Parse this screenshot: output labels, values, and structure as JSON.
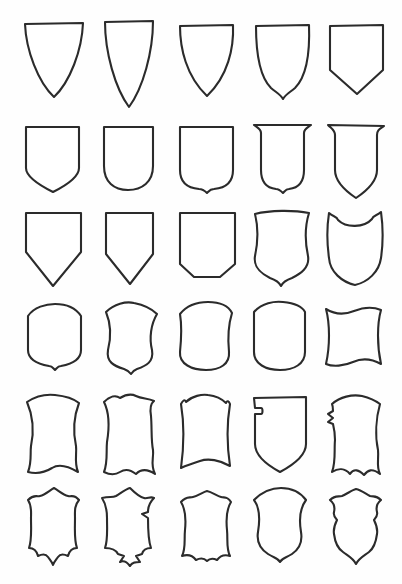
{
  "document": {
    "title": "Escutcheon Shapes Reference Sheet",
    "description": "Hand-drawn line-art sheet of thirty heraldic shield (escutcheon) outlines arranged in a five-column, six-row grid on a plain white page.",
    "background_color": "#fefefe",
    "stroke_color": "#2b2b2b",
    "fill_color": "#ffffff",
    "columns": 5,
    "rows": 6,
    "shape_count": 30,
    "page_width": 402,
    "page_height": 584
  },
  "grid": {
    "shapes": [
      {
        "index": 1,
        "row": 1,
        "column": 1,
        "name": "heater-shield-pointed",
        "label": "Heater shield, broad with sharp point",
        "x": 22,
        "y": 20,
        "width": 64,
        "height": 80,
        "path": "M3,4 L61,3 C60,30 48,62 32,77 C16,62 4,30 3,4 Z"
      },
      {
        "index": 2,
        "row": 1,
        "column": 2,
        "name": "heater-shield-narrow-elongated",
        "label": "Narrow elongated heater shield",
        "x": 100,
        "y": 18,
        "width": 58,
        "height": 92,
        "path": "M5,4 L53,3 C53,34 43,70 29,89 C15,70 5,34 5,4 Z"
      },
      {
        "index": 3,
        "row": 1,
        "column": 3,
        "name": "heater-shield-rounded-flank",
        "label": "Heater shield with rounded flanks",
        "x": 176,
        "y": 22,
        "width": 62,
        "height": 78,
        "path": "M4,4 L57,3 C58,26 52,54 31,74 C10,54 4,26 4,4 Z"
      },
      {
        "index": 4,
        "row": 1,
        "column": 4,
        "name": "shield-ogee-cusped-point",
        "label": "Shield with ogee cusped base point",
        "x": 252,
        "y": 22,
        "width": 62,
        "height": 80,
        "path": "M4,4 L57,3 C58,30 55,54 43,66 C37,71 33,73 31,77 C29,73 25,71 19,66 C7,54 4,30 4,4 Z"
      },
      {
        "index": 5,
        "row": 1,
        "column": 5,
        "name": "shield-straight-chamfered-base",
        "label": "Straight-sided shield, chamfered base",
        "x": 326,
        "y": 22,
        "width": 62,
        "height": 76,
        "path": "M4,4 L57,3 L57,48 L31,72 L4,48 Z"
      },
      {
        "index": 6,
        "row": 2,
        "column": 1,
        "name": "shield-square-chamfered",
        "label": "Square-shouldered shield, chamfered base",
        "x": 22,
        "y": 124,
        "width": 62,
        "height": 72,
        "path": "M4,3 L57,3 L57,44 C57,52 47,60 31,68 C15,60 4,52 4,44 Z"
      },
      {
        "index": 7,
        "row": 2,
        "column": 2,
        "name": "shield-u-round-base",
        "label": "U-shaped shield with round base",
        "x": 100,
        "y": 124,
        "width": 58,
        "height": 70,
        "path": "M4,3 L53,3 L53,42 C53,58 42,66 28,66 C14,66 4,58 4,42 Z"
      },
      {
        "index": 8,
        "row": 2,
        "column": 3,
        "name": "shield-round-corners-nipple",
        "label": "Shield with round corners and central nipple",
        "x": 176,
        "y": 124,
        "width": 62,
        "height": 72,
        "path": "M4,3 L57,3 L57,46 C57,58 50,64 38,65 C34,65 33,67 31,69 C29,67 27,65 23,65 C11,64 4,58 4,46 Z"
      },
      {
        "index": 9,
        "row": 2,
        "column": 4,
        "name": "shield-flanged-top-nipple-base",
        "label": "Shield with flared top flanges and nipple base",
        "x": 252,
        "y": 122,
        "width": 64,
        "height": 74,
        "path": "M2,3 L59,3 C55,6 52,7 52,11 L52,48 C52,60 46,66 37,67 C34,67 33,69 31,71 C29,69 27,67 24,67 C15,66 9,60 9,48 L9,11 C9,7 6,6 2,3 Z"
      },
      {
        "index": 10,
        "row": 2,
        "column": 5,
        "name": "shield-flanged-top-pointed-base",
        "label": "Shield with flared top flanges and pointed base",
        "x": 326,
        "y": 122,
        "width": 62,
        "height": 78,
        "path": "M2,3 L58,4 C54,7 51,8 51,13 L51,48 C51,58 42,68 30,76 C18,68 9,58 9,48 L9,13 C9,8 6,7 2,3 Z"
      },
      {
        "index": 11,
        "row": 3,
        "column": 1,
        "name": "shield-straight-deep-point",
        "label": "Straight-sided shield with deep V point",
        "x": 22,
        "y": 210,
        "width": 64,
        "height": 80,
        "path": "M4,3 L59,3 L59,42 L31,76 L4,42 Z"
      },
      {
        "index": 12,
        "row": 3,
        "column": 2,
        "name": "shield-narrow-deep-point",
        "label": "Narrow shield with deep V point",
        "x": 102,
        "y": 210,
        "width": 56,
        "height": 78,
        "path": "M4,3 L51,3 L51,44 L28,74 L4,44 Z"
      },
      {
        "index": 13,
        "row": 3,
        "column": 3,
        "name": "shield-broad-shallow-chamfer",
        "label": "Broad shield with shallow chamfered base",
        "x": 176,
        "y": 210,
        "width": 64,
        "height": 74,
        "path": "M4,3 L59,3 L59,54 L44,67 L18,67 L4,54 Z"
      },
      {
        "index": 14,
        "row": 3,
        "column": 4,
        "name": "shield-curved-flank-cusped",
        "label": "Shield with curved flanks and cusped point",
        "x": 250,
        "y": 208,
        "width": 66,
        "height": 80,
        "path": "M5,6 C20,2 44,2 59,5 C55,18 55,34 58,48 C60,60 50,66 42,70 C36,72 33,74 31,78 C29,74 26,72 20,70 C12,66 3,60 5,48 C8,34 8,18 5,6 Z"
      },
      {
        "index": 15,
        "row": 3,
        "column": 5,
        "name": "shield-dished-top-notched",
        "label": "Shield with concave dished top and notched corners",
        "x": 324,
        "y": 208,
        "width": 64,
        "height": 80,
        "path": "M5,5 C9,9 13,8 14,12 C22,20 40,20 48,11 C49,7 53,8 57,4 C59,18 59,36 57,50 C55,64 44,74 31,77 C18,74 6,64 5,50 C3,36 3,18 5,5 Z"
      },
      {
        "index": 16,
        "row": 4,
        "column": 1,
        "name": "shield-rounded-top-nipple",
        "label": "Rounded-top shield with small base nipple",
        "x": 24,
        "y": 302,
        "width": 62,
        "height": 72,
        "path": "M4,14 C10,5 22,2 31,2 C40,2 51,5 57,14 L57,48 C57,58 48,62 37,64 C34,64 33,66 31,68 C29,66 28,64 25,64 C14,62 4,58 4,48 Z"
      },
      {
        "index": 17,
        "row": 4,
        "column": 2,
        "name": "shield-waisted-curvy-nipple",
        "label": "Waisted curvy shield with base nipple",
        "x": 100,
        "y": 300,
        "width": 62,
        "height": 76,
        "path": "M6,12 C14,4 26,1 34,3 C44,5 52,9 57,14 C51,24 49,38 52,50 C54,62 46,66 37,69 C34,70 33,71 31,74 C29,71 27,70 24,69 C14,66 6,62 8,50 C11,38 11,24 6,12 Z"
      },
      {
        "index": 18,
        "row": 4,
        "column": 3,
        "name": "shield-arched-top-round-base",
        "label": "Arched-top shield with deep round base",
        "x": 176,
        "y": 300,
        "width": 60,
        "height": 74,
        "path": "M4,14 C12,4 24,2 32,2 C42,2 52,5 56,13 C52,26 52,42 53,52 C54,64 44,70 30,70 C16,70 3,64 4,52 C5,42 6,26 4,14 Z"
      },
      {
        "index": 19,
        "row": 4,
        "column": 4,
        "name": "shield-arched-top-u-base",
        "label": "Arched top shield with U base",
        "x": 250,
        "y": 300,
        "width": 60,
        "height": 74,
        "path": "M4,12 C12,3 24,1 33,2 C43,3 52,6 55,12 L55,52 C55,64 44,70 30,70 C16,70 4,64 4,52 Z"
      },
      {
        "index": 20,
        "row": 4,
        "column": 5,
        "name": "cartouche-wavy-concave",
        "label": "Wavy cartouche with concave top and bottom",
        "x": 322,
        "y": 302,
        "width": 64,
        "height": 70,
        "path": "M4,7 C12,12 22,13 32,9 C42,5 52,5 59,8 C55,22 55,44 59,62 C50,57 40,56 31,60 C22,64 11,65 4,62 C8,44 8,22 4,7 Z"
      },
      {
        "index": 21,
        "row": 5,
        "column": 1,
        "name": "cartouche-scroll-sides",
        "label": "Cartouche with scrolled concave sides",
        "x": 22,
        "y": 392,
        "width": 62,
        "height": 84,
        "path": "M5,10 C14,4 24,2 33,3 C43,4 52,7 57,11 C52,24 51,40 54,54 C55,62 52,70 56,80 C46,74 36,72 30,76 C22,81 14,82 6,80 C10,70 8,62 9,54 C12,40 11,24 5,10 Z"
      },
      {
        "index": 22,
        "row": 5,
        "column": 2,
        "name": "cartouche-notched-corners",
        "label": "Cartouche with notched corners and scalloped base",
        "x": 98,
        "y": 392,
        "width": 64,
        "height": 86,
        "path": "M6,10 C12,4 18,3 22,6 C27,3 32,1 38,4 C44,7 50,6 56,9 C52,12 52,18 53,24 C54,36 53,48 55,58 C56,66 52,72 57,82 C48,76 42,78 38,82 C33,78 28,76 22,80 C16,84 10,82 6,80 C10,70 8,60 9,50 C11,38 12,22 6,10 Z"
      },
      {
        "index": 23,
        "row": 5,
        "column": 3,
        "name": "cartouche-flat-arched-top",
        "label": "Cartouche with arched top and concave base",
        "x": 176,
        "y": 392,
        "width": 58,
        "height": 82,
        "path": "M5,12 C7,8 9,7 10,10 C16,4 26,2 32,3 C40,4 46,7 50,11 C51,8 53,9 54,12 C51,30 51,54 54,74 C44,68 32,66 24,69 C16,72 9,74 5,76 C8,54 8,30 5,12 Z"
      },
      {
        "index": 24,
        "row": 5,
        "column": 4,
        "name": "shield-bouche-lance-notch",
        "label": "Bouched shield with lance-rest notch at upper left",
        "x": 250,
        "y": 392,
        "width": 62,
        "height": 84,
        "path": "M4,6 L56,5 L56,52 C56,62 45,72 30,80 C15,72 5,62 5,52 L5,22 L11,22 C13,22 13,16 11,16 L5,16 L4,6 Z"
      },
      {
        "index": 25,
        "row": 5,
        "column": 5,
        "name": "cartouche-bouche-scalloped-base",
        "label": "Bouched cartouche with scalloped base",
        "x": 324,
        "y": 392,
        "width": 62,
        "height": 86,
        "path": "M8,12 C16,5 28,2 38,4 C46,6 52,9 56,12 C52,26 51,44 54,58 C55,68 52,74 56,82 C48,76 44,78 40,83 C35,78 30,76 26,82 C21,76 14,76 8,80 C12,70 10,58 11,48 C11,42 10,36 9,32 L4,30 L9,26 L4,22 L9,19 C9,16 9,14 8,12 Z"
      },
      {
        "index": 26,
        "row": 6,
        "column": 1,
        "name": "cartouche-cusped-peaked-top",
        "label": "Cusped cartouche with peaked top and pointed base",
        "x": 22,
        "y": 486,
        "width": 62,
        "height": 84,
        "path": "M6,14 C12,8 14,11 18,10 C23,9 28,4 32,2 C36,4 41,9 46,10 C50,11 52,8 57,14 C52,20 53,26 53,32 C53,44 52,54 55,62 C50,62 47,66 46,70 C42,68 38,68 36,71 C34,74 32,76 31,79 C30,76 28,74 26,71 C24,68 20,68 16,70 C15,66 12,62 7,62 C10,54 9,44 9,32 C9,26 10,20 6,14 Z"
      },
      {
        "index": 27,
        "row": 6,
        "column": 2,
        "name": "cartouche-stepped-cusped",
        "label": "Stepped cusped cartouche with notched flanks",
        "x": 96,
        "y": 486,
        "width": 64,
        "height": 88,
        "path": "M6,12 C14,10 16,12 20,10 C25,7 30,3 34,2 C38,6 43,11 48,12 C52,13 54,10 58,12 C54,16 52,20 52,26 L46,28 L52,32 C52,44 52,54 55,62 C50,62 47,64 46,68 L40,70 L44,76 C40,76 36,76 34,80 C31,76 28,74 24,76 L28,70 L22,68 C20,64 16,62 9,62 C12,54 11,44 11,32 C11,26 10,18 6,12 Z"
      },
      {
        "index": 28,
        "row": 6,
        "column": 3,
        "name": "cartouche-rounded-cusped-base",
        "label": "Rounded cartouche with cusped wavy base",
        "x": 176,
        "y": 488,
        "width": 60,
        "height": 80,
        "path": "M5,14 C10,8 13,10 17,9 C22,8 27,4 31,3 C36,4 41,8 45,9 C49,10 51,8 55,14 C50,22 50,32 51,42 C52,52 50,60 54,68 C48,66 44,68 41,72 C37,70 34,70 31,73 C28,70 24,70 20,72 C17,68 12,66 6,68 C10,60 8,52 9,42 C10,32 10,22 5,14 Z"
      },
      {
        "index": 29,
        "row": 6,
        "column": 4,
        "name": "cartouche-broad-rounded-nipple",
        "label": "Broad rounded cartouche with base nipple",
        "x": 248,
        "y": 486,
        "width": 64,
        "height": 82,
        "path": "M6,14 C14,6 24,2 33,2 C43,2 52,6 58,14 C52,22 51,34 53,46 C55,58 50,64 44,68 C38,72 34,72 32,76 C30,72 26,72 20,68 C14,64 8,58 10,46 C12,34 12,22 6,14 Z"
      },
      {
        "index": 30,
        "row": 6,
        "column": 5,
        "name": "cartouche-scalloped-flanks",
        "label": "Cartouche with scalloped flanks and cusped base",
        "x": 324,
        "y": 486,
        "width": 62,
        "height": 84,
        "path": "M6,14 C11,9 14,11 18,10 C23,8 28,4 32,3 C37,4 42,8 46,10 C50,11 52,9 57,14 C52,18 52,22 53,26 C54,30 52,32 50,34 C52,38 54,42 53,48 C52,56 50,62 45,66 C40,70 35,72 32,78 C29,72 24,70 19,66 C13,62 11,56 10,48 C9,42 11,38 13,34 C11,32 9,30 10,26 C11,22 11,18 6,14 Z"
      }
    ]
  }
}
